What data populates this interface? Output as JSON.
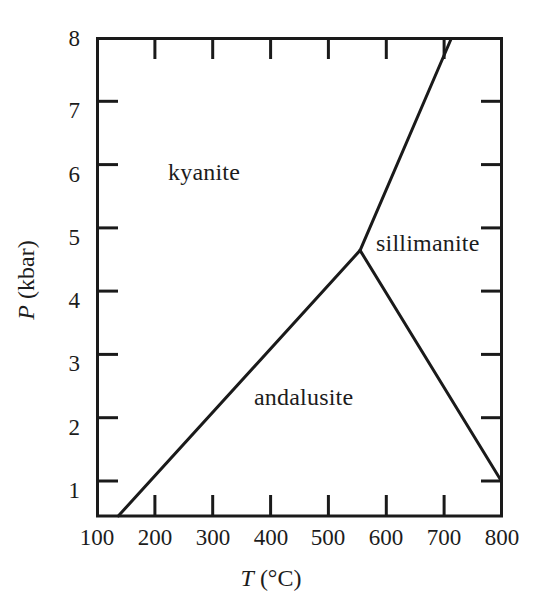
{
  "figure": {
    "background_color": "#ffffff",
    "line_color": "#1a1a1a",
    "axis_color": "#1a1a1a"
  },
  "axes": {
    "x_title_symbol": "T",
    "x_title_unit": "(°C)",
    "y_title_symbol": "P",
    "y_title_unit": "(kbar)",
    "x_ticks": [
      "100",
      "200",
      "300",
      "400",
      "500",
      "600",
      "700",
      "800"
    ],
    "y_ticks": [
      "1",
      "2",
      "3",
      "4",
      "5",
      "6",
      "7",
      "8"
    ]
  },
  "regions": {
    "kyanite": "kyanite",
    "sillimanite": "sillimanite",
    "andalusite": "andalusite"
  },
  "chart_data": {
    "type": "line",
    "title": "",
    "subtitle": "",
    "xlabel": "T (°C)",
    "ylabel": "P (kbar)",
    "xlim": [
      100,
      800
    ],
    "ylim": [
      0.45,
      8
    ],
    "grid": false,
    "legend": "none",
    "xticks": [
      100,
      200,
      300,
      400,
      500,
      600,
      700,
      800
    ],
    "yticks": [
      1,
      2,
      3,
      4,
      5,
      6,
      7,
      8
    ],
    "annotations": [
      {
        "text": "kyanite",
        "x": 245,
        "y": 5.85
      },
      {
        "text": "sillimanite",
        "x": 655,
        "y": 4.55
      },
      {
        "text": "andalusite",
        "x": 470,
        "y": 2.25
      }
    ],
    "triple_point": {
      "x": 555,
      "y": 4.65
    },
    "series": [
      {
        "name": "kyanite–andalusite boundary",
        "x": [
          136,
          555
        ],
        "y": [
          0.45,
          4.65
        ]
      },
      {
        "name": "kyanite–sillimanite boundary",
        "x": [
          555,
          713
        ],
        "y": [
          4.65,
          8.0
        ]
      },
      {
        "name": "andalusite–sillimanite boundary",
        "x": [
          555,
          800
        ],
        "y": [
          4.65,
          1.0
        ]
      }
    ]
  }
}
